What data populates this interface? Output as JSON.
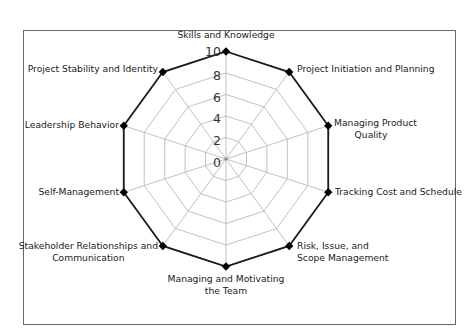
{
  "chart_data": {
    "type": "radar",
    "title": "",
    "categories": [
      "Skills and Knowledge",
      "Project Initiation and Planning",
      "Managing Product Quality",
      "Tracking Cost and Schedule",
      "Risk, Issue, and Scope Management",
      "Managing and Motivating the Team",
      "Stakeholder Relationships and Communication",
      "Self-Management",
      "Leadership Behavior",
      "Project Stability and Identity"
    ],
    "series": [
      {
        "name": "Score",
        "values": [
          10,
          10,
          10,
          10,
          10,
          10,
          10,
          10,
          10,
          10
        ]
      }
    ],
    "radial_ticks": [
      "0",
      "2",
      "4",
      "6",
      "8",
      "10"
    ],
    "rlim": [
      0,
      10
    ],
    "grid": true,
    "legend": null,
    "colors": {
      "series_line": "#1a1a1a",
      "grid": "#b3b3b3",
      "frame": "#666666",
      "marker": "#000000"
    }
  },
  "labels": [
    {
      "lines": [
        "Skills and Knowledge"
      ],
      "x": 226,
      "y": 38,
      "anchor": "middle"
    },
    {
      "lines": [
        "Project Initiation and Planning"
      ],
      "x": 297,
      "y": 72,
      "anchor": "start"
    },
    {
      "lines": [
        "Managing Product",
        "Quality"
      ],
      "x": 334,
      "y": 126,
      "anchor": "start",
      "align_center_second": 371
    },
    {
      "lines": [
        "Tracking Cost and Schedule"
      ],
      "x": 335,
      "y": 195,
      "anchor": "start"
    },
    {
      "lines": [
        "Risk, Issue, and",
        "Scope Management"
      ],
      "x": 297,
      "y": 249,
      "anchor": "start"
    },
    {
      "lines": [
        "Managing and Motivating",
        "the Team"
      ],
      "x": 226,
      "y": 282,
      "anchor": "middle"
    },
    {
      "lines": [
        "Stakeholder Relationships and",
        "Communication"
      ],
      "x": 158,
      "y": 249,
      "anchor": "end"
    },
    {
      "lines": [
        "Self-Management"
      ],
      "x": 119,
      "y": 195,
      "anchor": "end"
    },
    {
      "lines": [
        "Leadership Behavior"
      ],
      "x": 119,
      "y": 128,
      "anchor": "end"
    },
    {
      "lines": [
        "Project Stability and Identity"
      ],
      "x": 158,
      "y": 72,
      "anchor": "end"
    }
  ]
}
